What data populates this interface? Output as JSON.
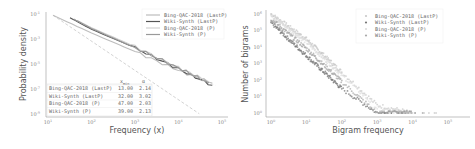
{
  "chart_data": [
    {
      "type": "line",
      "title": "",
      "xlabel": "Frequency (x)",
      "ylabel": "Probability density",
      "xscale": "log",
      "yscale": "log",
      "xlim": [
        10,
        100000
      ],
      "ylim": [
        1e-09,
        0.1
      ],
      "x_ticks": [
        "10^1",
        "10^2",
        "10^3",
        "10^4",
        "10^5"
      ],
      "y_ticks": [
        "10^-1",
        "10^-3",
        "10^-5",
        "10^-7",
        "10^-9"
      ],
      "legend_position": "upper right",
      "series": [
        {
          "name": "Bing-QAC-2018 (LastP)",
          "color": "#bdbdbd",
          "x": [
            13,
            100,
            1000,
            10000,
            60000
          ],
          "y": [
            0.08,
            0.003,
            0.0001,
            3e-06,
            3e-07
          ]
        },
        {
          "name": "Wiki-Synth (LastP)",
          "color": "#555555",
          "x": [
            32,
            100,
            1000,
            10000,
            60000
          ],
          "y": [
            0.05,
            0.006,
            0.0002,
            4e-06,
            2e-07
          ]
        },
        {
          "name": "Bing-QAC-2018 (P)",
          "color": "#d0d0d0",
          "x": [
            47,
            100,
            1000,
            10000,
            50000
          ],
          "y": [
            0.03,
            0.008,
            0.00025,
            5e-06,
            4e-07
          ]
        },
        {
          "name": "Wiki-Synth (P)",
          "color": "#999999",
          "x": [
            39,
            100,
            1000,
            10000,
            50000
          ],
          "y": [
            0.04,
            0.007,
            0.0002,
            5e-06,
            3e-07
          ]
        }
      ],
      "fit_lines": {
        "style": "dashed",
        "color": "#bbbbbb"
      },
      "table": {
        "headers": [
          "",
          "x_min",
          "α"
        ],
        "rows": [
          [
            "Bing-QAC-2018 (LastP)",
            "13.00",
            "2.14"
          ],
          [
            "Wiki-Synth (LastP)",
            "32.00",
            "3.02"
          ],
          [
            "Bing-QAC-2018 (P)",
            "47.00",
            "2.03"
          ],
          [
            "Wiki-Synth (P)",
            "39.00",
            "2.13"
          ]
        ]
      },
      "grid": false
    },
    {
      "type": "scatter",
      "title": "",
      "xlabel": "Bigram frequency",
      "ylabel": "Number of bigrams",
      "xscale": "log",
      "yscale": "log",
      "xlim": [
        1,
        100000
      ],
      "ylim": [
        1,
        1000000
      ],
      "x_ticks": [
        "10^0",
        "10^1",
        "10^2",
        "10^3",
        "10^4",
        "10^5"
      ],
      "y_ticks": [
        "10^0",
        "10^1",
        "10^2",
        "10^3",
        "10^4",
        "10^5",
        "10^6"
      ],
      "legend_position": "upper right",
      "series": [
        {
          "name": "Bing-QAC-2018 (LastP)",
          "color": "#c8c8c8",
          "x": [
            1,
            10,
            100,
            1000,
            10000
          ],
          "y": [
            1000000,
            30000,
            300,
            3,
            1
          ]
        },
        {
          "name": "Wiki-Synth (LastP)",
          "color": "#777777",
          "x": [
            1,
            10,
            100,
            1000,
            10000
          ],
          "y": [
            300000,
            3000,
            30,
            1,
            1
          ]
        },
        {
          "name": "Bing-QAC-2018 (P)",
          "color": "#dddddd",
          "x": [
            1,
            10,
            100,
            1000,
            10000
          ],
          "y": [
            800000,
            20000,
            200,
            2,
            1
          ]
        },
        {
          "name": "Wiki-Synth (P)",
          "color": "#aaaaaa",
          "x": [
            1,
            10,
            100,
            1000,
            10000
          ],
          "y": [
            500000,
            8000,
            80,
            1,
            1
          ]
        }
      ],
      "grid": false
    }
  ]
}
